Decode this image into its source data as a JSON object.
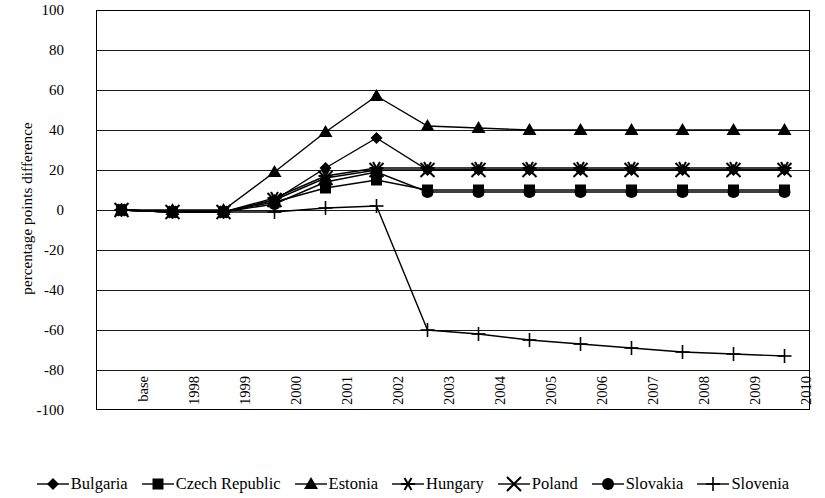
{
  "chart_data": {
    "type": "line",
    "title": "",
    "xlabel": "",
    "ylabel": "percentage points difference",
    "ylim": [
      -100,
      100
    ],
    "yticks": [
      100,
      80,
      60,
      40,
      20,
      0,
      -20,
      -40,
      -60,
      -80,
      -100
    ],
    "ytick_labels": [
      "100",
      "80",
      "60",
      "40",
      "20",
      "0",
      "-20",
      "-40",
      "-60",
      "-80",
      "-100"
    ],
    "grid": true,
    "legend_position": "bottom",
    "categories": [
      "base",
      "1998",
      "1999",
      "2000",
      "2001",
      "2002",
      "2003",
      "2004",
      "2005",
      "2006",
      "2007",
      "2008",
      "2009",
      "2010"
    ],
    "series": [
      {
        "name": "Bulgaria",
        "marker": "diamond",
        "values": [
          0,
          -1,
          -1,
          5,
          21,
          36,
          20,
          20,
          20,
          20,
          20,
          20,
          20,
          20
        ]
      },
      {
        "name": "Czech Republic",
        "marker": "square",
        "values": [
          0,
          -1,
          -1,
          4,
          11,
          15,
          10,
          10,
          10,
          10,
          10,
          10,
          10,
          10
        ]
      },
      {
        "name": "Estonia",
        "marker": "triangle",
        "values": [
          0,
          0,
          0,
          19,
          39,
          57,
          42,
          41,
          40,
          40,
          40,
          40,
          40,
          40
        ]
      },
      {
        "name": "Hungary",
        "marker": "asterisk",
        "values": [
          0,
          -1,
          -1,
          6,
          17,
          21,
          21,
          21,
          21,
          21,
          21,
          21,
          21,
          21
        ]
      },
      {
        "name": "Poland",
        "marker": "star",
        "values": [
          0,
          -1,
          -1,
          5,
          16,
          20,
          20,
          20,
          20,
          20,
          20,
          20,
          20,
          20
        ]
      },
      {
        "name": "Slovakia",
        "marker": "circle",
        "values": [
          0,
          -1,
          -1,
          3,
          14,
          19,
          9,
          9,
          9,
          9,
          9,
          9,
          9,
          9
        ]
      },
      {
        "name": "Slovenia",
        "marker": "plus",
        "values": [
          0,
          -1,
          -1,
          -1,
          1,
          2,
          -60,
          -62,
          -65,
          -67,
          -69,
          -71,
          -72,
          -73
        ]
      }
    ]
  },
  "axis": {
    "y_title": "percentage points difference"
  }
}
